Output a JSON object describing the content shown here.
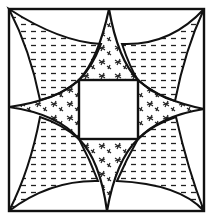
{
  "figure": {
    "colors": {
      "stroke": "#111111",
      "background": "#ffffff",
      "hatch": "#222222"
    },
    "regions": [
      {
        "name": "outer-square",
        "fill": "none"
      },
      {
        "name": "center-square",
        "fill": "blank"
      },
      {
        "name": "star",
        "fill": "asterisks"
      },
      {
        "name": "petal-top-left",
        "fill": "dashes"
      },
      {
        "name": "petal-top-right",
        "fill": "dashes"
      },
      {
        "name": "petal-bottom-left",
        "fill": "dashes"
      },
      {
        "name": "petal-bottom-right",
        "fill": "dashes"
      }
    ]
  }
}
